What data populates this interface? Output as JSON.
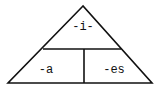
{
  "diagram": {
    "type": "triangle-mnemonic",
    "line_color": "#111111",
    "background": "#ffffff",
    "sections": {
      "top": {
        "label": "-i-"
      },
      "bottom_left": {
        "label": "-a"
      },
      "bottom_right": {
        "label": "-es"
      }
    }
  }
}
